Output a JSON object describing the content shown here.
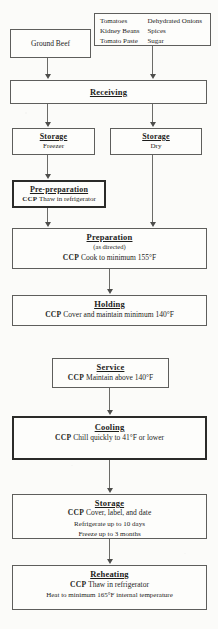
{
  "document": {
    "kind": "haccp-process-flow-chart",
    "title_text": "Chili Process Flow Chart"
  },
  "nodes": {
    "ground_beef": {
      "title": "Ground Beef"
    },
    "ingredients": {
      "col1": [
        "Tomatoes",
        "Kidney Beans",
        "Tomato Paste"
      ],
      "col2": [
        "Dehydrated Onions",
        "Spices",
        "Sugar"
      ]
    },
    "receiving": {
      "title": "Receiving"
    },
    "storage_freezer": {
      "title": "Storage",
      "detail": "Freezer"
    },
    "storage_dry": {
      "title": "Storage",
      "detail": "Dry"
    },
    "pre_preparation": {
      "title": "Pre-preparation",
      "ccp_tag": "CCP",
      "ccp_text": "Thaw in refrigerator"
    },
    "preparation": {
      "title": "Preparation",
      "detail": "(as directed)",
      "ccp_tag": "CCP",
      "ccp_text": "Cook to minimum 155°F"
    },
    "holding": {
      "title": "Holding",
      "ccp_tag": "CCP",
      "ccp_text": "Cover and maintain minimum 140°F"
    },
    "service": {
      "title": "Service",
      "ccp_tag": "CCP",
      "ccp_text": "Maintain above 140°F"
    },
    "cooling": {
      "title": "Cooling",
      "ccp_tag": "CCP",
      "ccp_text": "Chill quickly to 41°F or lower"
    },
    "storage_cooked": {
      "title": "Storage",
      "ccp_tag": "CCP",
      "ccp_text": "Cover, label, and date",
      "line2": "Refrigerate up to 10 days",
      "line3": "Freeze up to 3 months"
    },
    "reheating": {
      "title": "Reheating",
      "ccp_tag": "CCP",
      "ccp_text": "Thaw in refrigerator",
      "line2": "Heat to minimum 165°F internal temperature"
    }
  },
  "colors": {
    "paper": "#fbfbf9",
    "box_fill": "#fdfdfb",
    "border": "#5e5e5c",
    "ccp_border": "#2b2b29",
    "text": "#1d1d1b",
    "connector": "#6b6b68"
  }
}
